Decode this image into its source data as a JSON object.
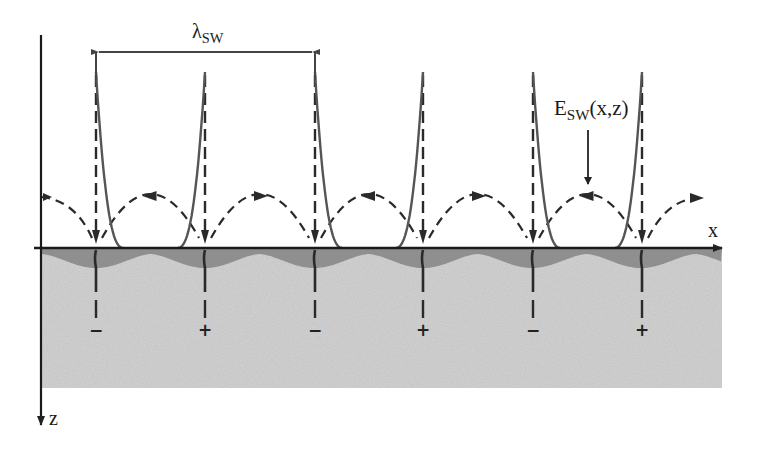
{
  "figure": {
    "type": "surface-wave charge distribution schematic",
    "axes": {
      "x_label": "x",
      "z_label": "z"
    },
    "wavelength_label": {
      "symbol": "λ",
      "subscript": "SW"
    },
    "field_label": {
      "main": "E",
      "subscript": "SW",
      "args": "(x,z)"
    },
    "nodes_x": [
      96,
      205,
      315,
      423,
      533,
      642
    ],
    "charges": [
      {
        "sign": "−",
        "x": 96
      },
      {
        "sign": "+",
        "x": 205
      },
      {
        "sign": "−",
        "x": 315
      },
      {
        "sign": "+",
        "x": 423
      },
      {
        "sign": "−",
        "x": 533
      },
      {
        "sign": "+",
        "x": 642
      }
    ],
    "colors": {
      "substrate": "#d4d4d4",
      "charge_region": "#8f8f8f",
      "lines": "#2a2a2a",
      "field_curves": "#555555"
    }
  }
}
